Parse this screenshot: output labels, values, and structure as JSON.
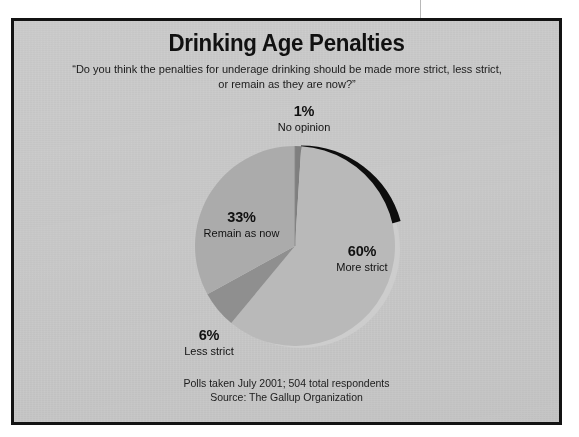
{
  "figure": {
    "title": "Drinking Age Penalties",
    "subtitle_line1": "“Do you think the penalties for underage drinking should be made more strict, less strict,",
    "subtitle_line2": "or remain as they are now?”",
    "footer_line1": "Polls taken July 2001; 504 total respondents",
    "footer_line2": "Source: The Gallup Organization",
    "panel_background": "#cdcdcd",
    "border_color": "#131313",
    "text_color": "#111111"
  },
  "labels": {
    "no_opinion": {
      "pct": "1%",
      "name": "No opinion"
    },
    "remain": {
      "pct": "33%",
      "name": "Remain as now"
    },
    "more": {
      "pct": "60%",
      "name": "More strict"
    },
    "less": {
      "pct": "6%",
      "name": "Less strict"
    }
  },
  "chart_data": {
    "type": "pie",
    "title": "Drinking Age Penalties",
    "subtitle": "“Do you think the penalties for underage drinking should be made more strict, less strict, or remain as they are now?”",
    "source": "Source: The Gallup Organization",
    "note": "Polls taken July 2001; 504 total respondents",
    "total_respondents": 504,
    "unit": "percent",
    "legend": "none (direct slice labels)",
    "start_angle_deg": 0,
    "direction": "clockwise",
    "categories": [
      "More strict",
      "Less strict",
      "Remain as now",
      "No opinion"
    ],
    "values": [
      60,
      6,
      33,
      1
    ],
    "colors": [
      "#b9b9b9",
      "#8f8f8f",
      "#ababab",
      "#7f7f7f"
    ],
    "slices": [
      {
        "label": "More strict",
        "value": 60,
        "value_text": "60%",
        "color": "#b9b9b9"
      },
      {
        "label": "Less strict",
        "value": 6,
        "value_text": "6%",
        "color": "#8f8f8f"
      },
      {
        "label": "Remain as now",
        "value": 33,
        "value_text": "33%",
        "color": "#ababab"
      },
      {
        "label": "No opinion",
        "value": 1,
        "value_text": "1%",
        "color": "#7f7f7f"
      }
    ]
  }
}
